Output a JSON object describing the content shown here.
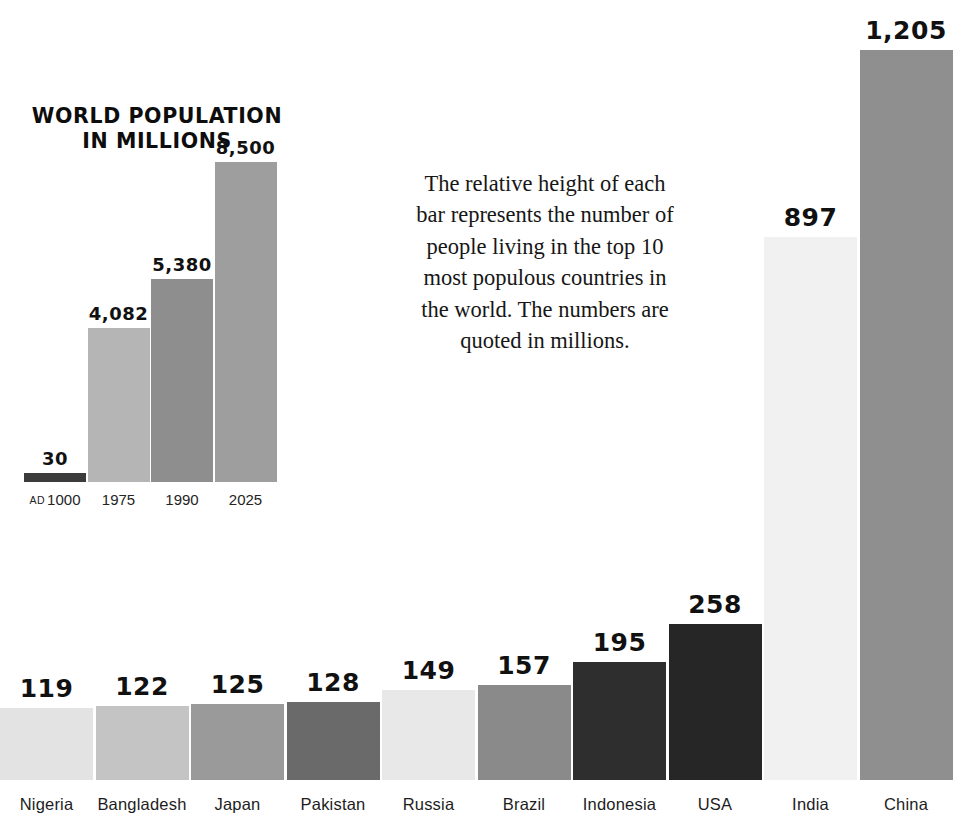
{
  "inset": {
    "title": "WORLD POPULATION\nIN MILLIONS",
    "title_line1": "WORLD POPULATION",
    "title_line2": "IN MILLIONS"
  },
  "caption": {
    "text": "The relative height of each bar represents the number of people living in the top 10 most populous countries in the world. The numbers are quoted in millions."
  },
  "chart_data": [
    {
      "type": "bar",
      "id": "top-10-populous-countries",
      "title": "",
      "xlabel": "",
      "ylabel": "",
      "categories": [
        "Nigeria",
        "Bangladesh",
        "Japan",
        "Pakistan",
        "Russia",
        "Brazil",
        "Indonesia",
        "USA",
        "India",
        "China"
      ],
      "values": [
        119,
        122,
        125,
        128,
        149,
        157,
        195,
        258,
        897,
        1205
      ],
      "value_labels": [
        "119",
        "122",
        "125",
        "128",
        "149",
        "157",
        "195",
        "258",
        "897",
        "1,205"
      ],
      "bar_colors": [
        "#e3e3e3",
        "#c4c4c4",
        "#9a9a9a",
        "#6a6a6a",
        "#e8e8e8",
        "#8a8a8a",
        "#2e2e2e",
        "#262626",
        "#f1f1f1",
        "#8f8f8f"
      ],
      "ylim": [
        0,
        1205
      ],
      "grid": false,
      "legend": "none",
      "units": "millions"
    },
    {
      "type": "bar",
      "id": "world-population-history",
      "title": "WORLD POPULATION IN MILLIONS",
      "xlabel": "",
      "ylabel": "",
      "categories": [
        "AD 1000",
        "1975",
        "1990",
        "2025"
      ],
      "category_eras": [
        "AD",
        "",
        "",
        ""
      ],
      "category_years": [
        "1000",
        "1975",
        "1990",
        "2025"
      ],
      "values": [
        30,
        4082,
        5380,
        8500
      ],
      "value_labels": [
        "30",
        "4,082",
        "5,380",
        "8,500"
      ],
      "bar_colors": [
        "#3b3b3b",
        "#b5b5b5",
        "#8e8e8e",
        "#9e9e9e"
      ],
      "ylim": [
        0,
        8500
      ],
      "grid": false,
      "legend": "none",
      "units": "millions"
    }
  ],
  "colors": {
    "background": "#ffffff",
    "text": "#111111",
    "label": "#1d1d1d"
  }
}
